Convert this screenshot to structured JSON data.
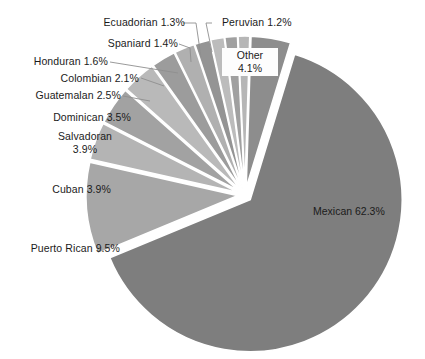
{
  "chart_data": {
    "type": "pie",
    "title": "",
    "subtitle": "",
    "xlabel": "",
    "ylabel": "",
    "legend_position": "none",
    "grid": false,
    "exploded": true,
    "units": "percent",
    "categories": [
      "Mexican",
      "Puerto Rican",
      "Cuban",
      "Salvadoran",
      "Dominican",
      "Guatemalan",
      "Colombian",
      "Honduran",
      "Spaniard",
      "Ecuadorian",
      "Peruvian",
      "Other"
    ],
    "values": [
      62.3,
      9.5,
      3.9,
      3.9,
      3.5,
      2.5,
      2.1,
      1.6,
      1.4,
      1.3,
      1.2,
      4.1
    ],
    "slices": [
      {
        "label": "Mexican 62.3%",
        "name": "Mexican",
        "value": 62.3,
        "color": "#7e7e7e",
        "label_placement": "inside"
      },
      {
        "label": "Puerto Rican 9.5%",
        "name": "Puerto Rican",
        "value": 9.5,
        "color": "#a7a7a7",
        "label_placement": "outside"
      },
      {
        "label": "Cuban 3.9%",
        "name": "Cuban",
        "value": 3.9,
        "color": "#b4b4b4",
        "label_placement": "outside"
      },
      {
        "label": "Salvadoran\n3.9%",
        "name": "Salvadoran",
        "value": 3.9,
        "color": "#a2a2a2",
        "label_placement": "outside"
      },
      {
        "label": "Dominican 3.5%",
        "name": "Dominican",
        "value": 3.5,
        "color": "#b9b9b9",
        "label_placement": "outside"
      },
      {
        "label": "Guatemalan 2.5%",
        "name": "Guatemalan",
        "value": 2.5,
        "color": "#9c9c9c",
        "label_placement": "outside"
      },
      {
        "label": "Colombian 2.1%",
        "name": "Colombian",
        "value": 2.1,
        "color": "#b0b0b0",
        "label_placement": "outside"
      },
      {
        "label": "Honduran 1.6%",
        "name": "Honduran",
        "value": 1.6,
        "color": "#949494",
        "label_placement": "outside"
      },
      {
        "label": "Spaniard 1.4%",
        "name": "Spaniard",
        "value": 1.4,
        "color": "#bcbcbc",
        "label_placement": "outside"
      },
      {
        "label": "Ecuadorian 1.3%",
        "name": "Ecuadorian",
        "value": 1.3,
        "color": "#a0a0a0",
        "label_placement": "outside"
      },
      {
        "label": "Peruvian 1.2%",
        "name": "Peruvian",
        "value": 1.2,
        "color": "#b6b6b6",
        "label_placement": "outside"
      },
      {
        "label": "Other\n4.1%",
        "name": "Other",
        "value": 4.1,
        "color": "#8d8d8d",
        "label_placement": "boxed"
      }
    ]
  },
  "labels": {
    "mexican": "Mexican 62.3%",
    "puerto_rican": "Puerto Rican 9.5%",
    "cuban": "Cuban 3.9%",
    "salvadoran": "Salvadoran\n3.9%",
    "dominican": "Dominican 3.5%",
    "guatemalan": "Guatemalan 2.5%",
    "colombian": "Colombian 2.1%",
    "honduran": "Honduran 1.6%",
    "spaniard": "Spaniard 1.4%",
    "ecuadorian": "Ecuadorian 1.3%",
    "peruvian": "Peruvian 1.2%",
    "other": "Other\n4.1%"
  },
  "colors": {
    "background": "#ffffff",
    "text": "#1b1b1b",
    "leader_line": "#8f8f8f",
    "slice_gap": "#ffffff"
  }
}
